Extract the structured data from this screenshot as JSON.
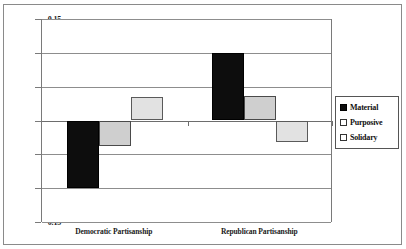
{
  "chart_data": {
    "type": "bar",
    "title": "",
    "subtitle": "",
    "xlabel": "",
    "ylabel": "",
    "categories": [
      "Democratic Partisanship",
      "Republican Partisanship"
    ],
    "series": [
      {
        "name": "Material",
        "values": [
          -0.1,
          0.1
        ],
        "color": "#0d0d0d"
      },
      {
        "name": "Purposive",
        "values": [
          -0.037,
          0.036
        ],
        "color": "#cfcfcf"
      },
      {
        "name": "Solidary",
        "values": [
          0.035,
          -0.032
        ],
        "color": "#e2e2e2"
      }
    ],
    "ylim": [
      -0.15,
      0.15
    ],
    "yticks": [
      0.15,
      0.1,
      0.05,
      0,
      -0.05,
      -0.1,
      -0.15
    ],
    "ytick_labels": [
      "0.15",
      "0.1",
      "0.05",
      "0",
      "-0.05",
      "-0.1",
      "-0.15"
    ],
    "grid": true,
    "grid_axis": "y",
    "legend_position": "right",
    "zero_line": 0
  },
  "legend": {
    "entries": [
      {
        "label": "Material",
        "swatch": "filled-black-square"
      },
      {
        "label": "Purposive",
        "swatch": "open-square"
      },
      {
        "label": "Solidary",
        "swatch": "open-square"
      }
    ]
  }
}
